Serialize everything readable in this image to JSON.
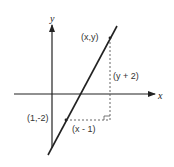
{
  "diagram": {
    "type": "coordinate-geometry",
    "colors": {
      "line": "#222222",
      "dashed": "#555555",
      "text": "#333333",
      "background": "#ffffff"
    },
    "axes": {
      "x_label": "x",
      "y_label": "y"
    },
    "points": [
      {
        "label": "(x,y)"
      },
      {
        "label": "(1,-2)"
      }
    ],
    "segments": [
      {
        "label": "(y + 2)"
      },
      {
        "label": "(x - 1)"
      }
    ]
  }
}
